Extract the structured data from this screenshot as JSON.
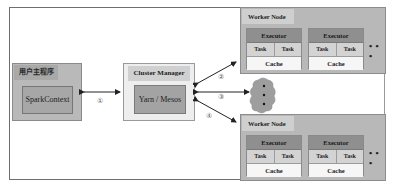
{
  "driver": {
    "title": "用户主程序",
    "component": "SparkContext"
  },
  "cluster_manager": {
    "title": "Cluster Manager",
    "component": "Yarn / Mesos"
  },
  "worker_nodes": [
    {
      "title": "Worker Node",
      "executors": [
        {
          "title": "Executor",
          "tasks": [
            "Task",
            "Task"
          ],
          "cache": "Cache"
        },
        {
          "title": "Executor",
          "tasks": [
            "Task",
            "Task"
          ],
          "cache": "Cache"
        }
      ],
      "more": "• • •"
    },
    {
      "title": "Worker Node",
      "executors": [
        {
          "title": "Executor",
          "tasks": [
            "Task",
            "Task"
          ],
          "cache": "Cache"
        },
        {
          "title": "Executor",
          "tasks": [
            "Task",
            "Task"
          ],
          "cache": "Cache"
        }
      ],
      "more": "• • •"
    }
  ],
  "step_labels": [
    "①",
    "②",
    "③",
    "④"
  ],
  "colors": {
    "driver_bg": "#b9b9b9",
    "cm_bg": "#eeeeee",
    "worker_bg": "#b8b8b8",
    "executor_head": "#8f8f8f",
    "task_bg": "#d3d3d3",
    "cache_bg": "#f6f6f6"
  }
}
